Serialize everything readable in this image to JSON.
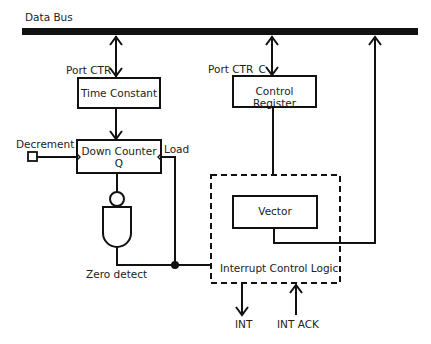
{
  "diagram": {
    "bus": {
      "label": "Data Bus"
    },
    "ports": {
      "ctr": "Port CTR",
      "ctr_c": "Port CTR_C"
    },
    "blocks": {
      "time_constant": "Time Constant",
      "control_register": "Control Register",
      "down_counter": "Down Counter",
      "down_counter_output": "Q",
      "vector": "Vector",
      "interrupt_control_logic": "Interrupt Control Logic"
    },
    "signals": {
      "decrement": "Decrement",
      "load": "Load",
      "zero_detect": "Zero detect",
      "int": "INT",
      "int_ack": "INT ACK"
    },
    "colors": {
      "line": "#111111",
      "background": "#ffffff"
    }
  }
}
